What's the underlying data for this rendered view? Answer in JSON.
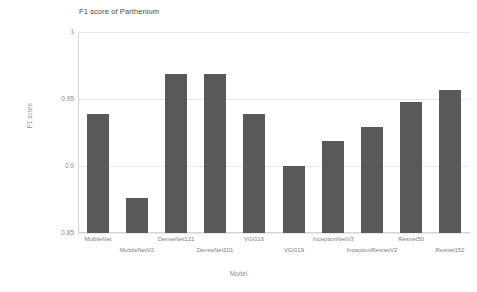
{
  "chart_data": {
    "type": "bar",
    "title": "F1 score of Parthenium",
    "xlabel": "Model",
    "ylabel": "F1 score",
    "ylim": [
      0.85,
      1.0
    ],
    "yticks": [
      "0.85",
      "0.9",
      "0.95",
      "1"
    ],
    "ytick_values": [
      0.85,
      0.9,
      0.95,
      1.0
    ],
    "grid": true,
    "legend": "none",
    "bar_color": "#595959",
    "categories": [
      "MobileNet",
      "MobileNetV2",
      "DenseNet121",
      "DenseNet201",
      "VGG16",
      "VGG19",
      "InceptionNetV3",
      "InceptionResnetV2",
      "Resnet50",
      "Resnet152"
    ],
    "values": [
      0.939,
      0.876,
      0.969,
      0.969,
      0.939,
      0.9,
      0.919,
      0.929,
      0.948,
      0.957
    ]
  },
  "axis": {
    "y_title": "F1 score",
    "x_title": "Model"
  }
}
